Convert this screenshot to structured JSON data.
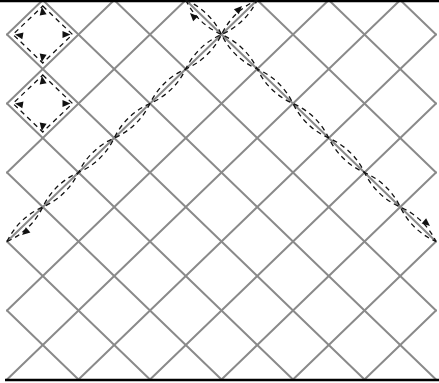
{
  "diagram": {
    "type": "diagonal-lattice-paths",
    "lattice": {
      "columns": 12,
      "rows": 11,
      "line_color": "#8a8a8a"
    },
    "boundaries": {
      "top": true,
      "bottom": true,
      "color": "#000000"
    },
    "dashed_color": "#111111",
    "loops": [
      {
        "name": "upper-loop",
        "cell": [
          1,
          1
        ],
        "arrows": [
          "up",
          "left",
          "right",
          "down"
        ]
      },
      {
        "name": "lower-loop",
        "cell": [
          1,
          3
        ],
        "arrows": [
          "up",
          "left",
          "right",
          "down"
        ]
      }
    ],
    "paths": [
      {
        "name": "sw-ne-path",
        "from_vertex": [
          0,
          7
        ],
        "to_vertex": [
          7,
          0
        ],
        "arrow_ends": [
          "south-west",
          "north-east"
        ]
      },
      {
        "name": "nw-se-path",
        "from_vertex": [
          5,
          0
        ],
        "to_vertex": [
          12,
          7
        ],
        "arrow_ends": [
          "north-west",
          "south-east"
        ]
      }
    ]
  }
}
